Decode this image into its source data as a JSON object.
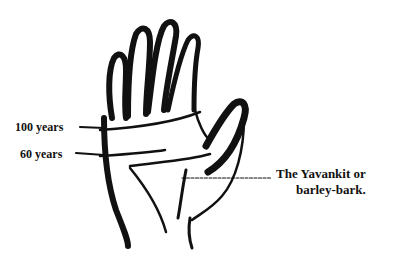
{
  "figure": {
    "ink_color": "#111111",
    "background_color": "#ffffff"
  },
  "labels": {
    "age_100": "100 years",
    "age_60": "60 years",
    "yavankit_line1": "The Yavankit or",
    "yavankit_line2": "barley-bark."
  }
}
